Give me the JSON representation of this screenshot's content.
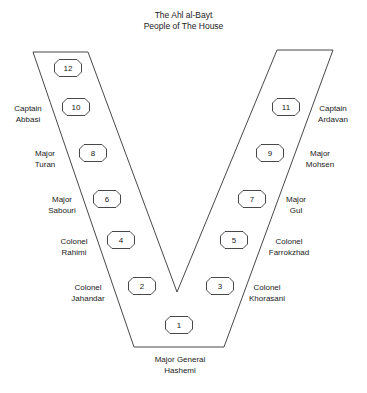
{
  "title": {
    "line1": "The Ahl al-Bayt",
    "line2": "People of The House"
  },
  "nodes": [
    {
      "id": "12",
      "x": 54,
      "y": 59
    },
    {
      "id": "10",
      "x": 62,
      "y": 98
    },
    {
      "id": "11",
      "x": 272,
      "y": 98
    },
    {
      "id": "8",
      "x": 79,
      "y": 144
    },
    {
      "id": "9",
      "x": 256,
      "y": 144
    },
    {
      "id": "6",
      "x": 93,
      "y": 190
    },
    {
      "id": "7",
      "x": 238,
      "y": 190
    },
    {
      "id": "4",
      "x": 107,
      "y": 231
    },
    {
      "id": "5",
      "x": 220,
      "y": 231
    },
    {
      "id": "2",
      "x": 128,
      "y": 277
    },
    {
      "id": "3",
      "x": 206,
      "y": 277
    },
    {
      "id": "1",
      "x": 165,
      "y": 316
    }
  ],
  "labels": [
    {
      "rank": "Captain",
      "name": "Abbasi",
      "x": 28,
      "y": 103
    },
    {
      "rank": "Captain",
      "name": "Ardavan",
      "x": 333,
      "y": 103
    },
    {
      "rank": "Major",
      "name": "Turan",
      "x": 45,
      "y": 148
    },
    {
      "rank": "Major",
      "name": "Mohsen",
      "x": 320,
      "y": 148
    },
    {
      "rank": "Major",
      "name": "Sabouri",
      "x": 62,
      "y": 194
    },
    {
      "rank": "Major",
      "name": "Gul",
      "x": 296,
      "y": 194
    },
    {
      "rank": "Colonel",
      "name": "Rahimi",
      "x": 74,
      "y": 236
    },
    {
      "rank": "Colonel",
      "name": "Farrokzhad",
      "x": 289,
      "y": 236
    },
    {
      "rank": "Colonel",
      "name": "Jahandar",
      "x": 88,
      "y": 282
    },
    {
      "rank": "Colonel",
      "name": "Khorasani",
      "x": 267,
      "y": 282
    },
    {
      "rank": "Major General",
      "name": "Hashemi",
      "x": 180,
      "y": 354
    }
  ],
  "shape": {
    "points": "33,52 88,52 177,292 277,50 333,50 224,347 134,347",
    "stroke": "#333333"
  }
}
